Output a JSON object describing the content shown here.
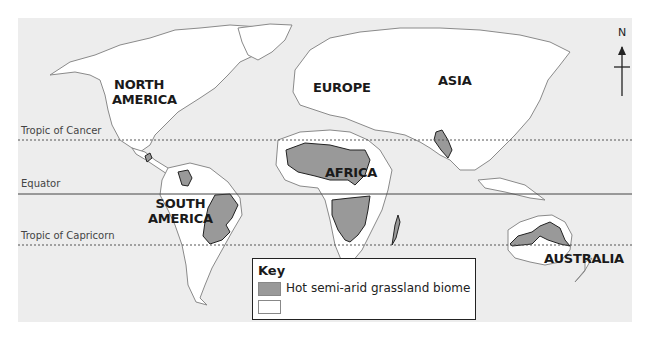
{
  "map": {
    "type": "world-biome-map",
    "colors": {
      "ocean": "#ededed",
      "land": "#ffffff",
      "coastline": "#8a8a8a",
      "biome": "#999999",
      "biome_outline": "#222222",
      "lines": "#444444"
    },
    "continents": [
      {
        "id": "north-america",
        "label_line1": "NORTH",
        "label_line2": "AMERICA"
      },
      {
        "id": "europe",
        "label_line1": "EUROPE"
      },
      {
        "id": "asia",
        "label_line1": "ASIA"
      },
      {
        "id": "africa",
        "label_line1": "AFRICA"
      },
      {
        "id": "south-america",
        "label_line1": "SOUTH",
        "label_line2": "AMERICA"
      },
      {
        "id": "australia",
        "label_line1": "AUSTRALIA"
      }
    ],
    "lines": {
      "tropic_of_cancer": "Tropic of Cancer",
      "equator": "Equator",
      "tropic_of_capricorn": "Tropic of Capricorn"
    },
    "compass": {
      "label": "N"
    },
    "key": {
      "title": "Key",
      "items": [
        {
          "label": "Hot semi-arid grassland biome",
          "color": "#999999"
        },
        {
          "label": "",
          "color": "#ffffff"
        }
      ]
    }
  }
}
